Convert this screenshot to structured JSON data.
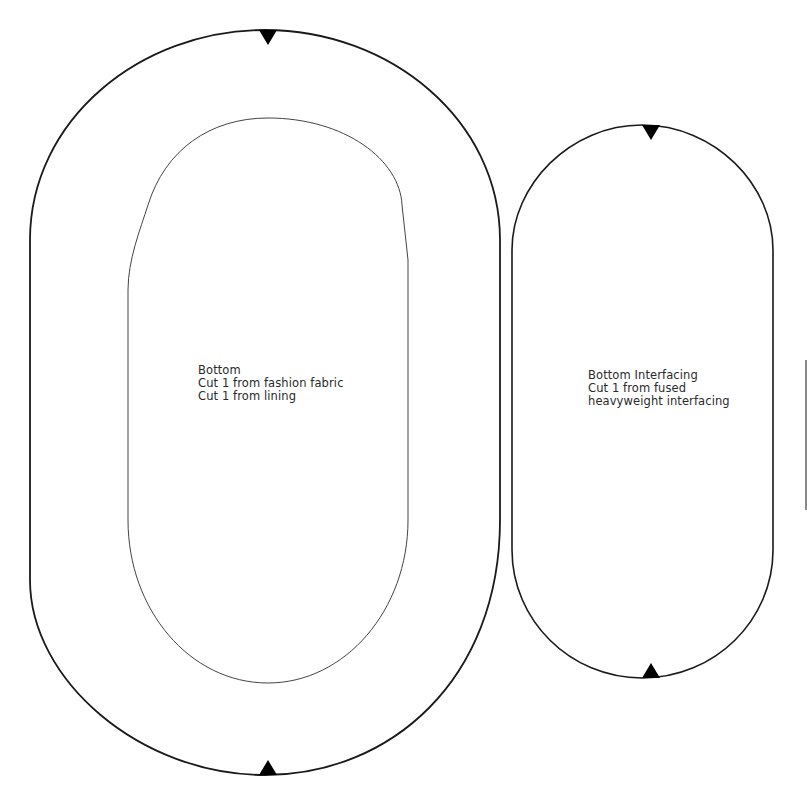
{
  "pieces": {
    "bottom": {
      "title": "Bottom",
      "lines": [
        "Bottom",
        "Cut 1 from fashion fabric",
        "Cut 1 from lining"
      ]
    },
    "interfacing": {
      "title": "Bottom Interfacing",
      "lines": [
        "Bottom Interfacing",
        "Cut 1 from fused",
        "heavyweight interfacing"
      ]
    }
  },
  "markers": {
    "notch_icon": "triangle-notch",
    "count": 4
  },
  "colors": {
    "outline": "#1a1a1a",
    "inner_outline": "#444444",
    "notch": "#000000",
    "background": "#ffffff"
  }
}
